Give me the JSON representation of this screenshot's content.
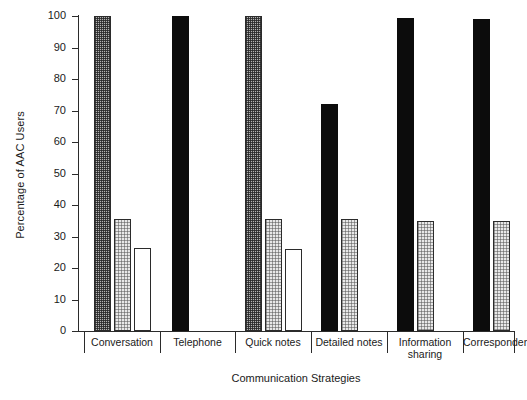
{
  "chart_data": {
    "type": "bar",
    "title": "",
    "xlabel": "Communication Strategies",
    "ylabel": "Percentage of AAC Users",
    "ylim": [
      0,
      100
    ],
    "yticks": [
      0,
      10,
      20,
      30,
      40,
      50,
      60,
      70,
      80,
      90,
      100
    ],
    "grid": false,
    "legend": "none",
    "categories": [
      "Conversation",
      "Telephone",
      "Quick notes",
      "Detailed notes",
      "Information\nsharing",
      "Correspondence"
    ],
    "bar_styles": {
      "dark_check": "dark checkered grey fill",
      "light_dot": "light grey stippled fill",
      "white": "white fill with black outline",
      "black": "solid black fill"
    },
    "groups": [
      {
        "category": "Conversation",
        "bars": [
          {
            "value": 100,
            "style": "dark-check"
          },
          {
            "value": 35.5,
            "style": "light-dot"
          },
          {
            "value": 26.5,
            "style": "white"
          }
        ]
      },
      {
        "category": "Telephone",
        "bars": [
          {
            "value": 100,
            "style": "black"
          }
        ]
      },
      {
        "category": "Quick notes",
        "bars": [
          {
            "value": 100,
            "style": "dark-check"
          },
          {
            "value": 35.5,
            "style": "light-dot"
          },
          {
            "value": 26,
            "style": "white"
          }
        ]
      },
      {
        "category": "Detailed notes",
        "bars": [
          {
            "value": 72,
            "style": "black"
          },
          {
            "value": 35.5,
            "style": "light-dot"
          }
        ]
      },
      {
        "category": "Information sharing",
        "bars": [
          {
            "value": 99.5,
            "style": "black"
          },
          {
            "value": 35,
            "style": "light-dot"
          }
        ]
      },
      {
        "category": "Correspondence",
        "bars": [
          {
            "value": 99,
            "style": "black"
          },
          {
            "value": 35,
            "style": "light-dot"
          }
        ]
      }
    ]
  },
  "axis": {
    "y_title": "Percentage of AAC Users",
    "x_title": "Communication Strategies",
    "tick_labels": [
      "0",
      "10",
      "20",
      "30",
      "40",
      "50",
      "60",
      "70",
      "80",
      "90",
      "100"
    ]
  },
  "layout": {
    "plot_left_px": 78,
    "plot_top_px": 16,
    "plot_width_px": 436,
    "plot_height_px": 315,
    "group_bounds_px": [
      [
        84,
        160
      ],
      [
        160,
        235
      ],
      [
        235,
        311
      ],
      [
        311,
        387
      ],
      [
        387,
        463
      ],
      [
        463,
        514
      ]
    ]
  },
  "colors": {
    "axis": "#2b2b2b",
    "black_bar": "#0c0c0c",
    "dark_check_bar": "#b4b4b4",
    "light_dot_bar": "#e8e8e8",
    "white_bar": "#ffffff",
    "background": "#ffffff"
  }
}
